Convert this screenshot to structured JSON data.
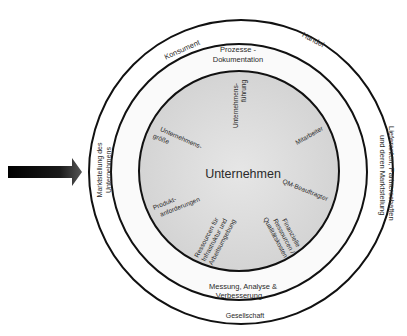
{
  "diagram": {
    "center_label": "Unternehmen",
    "outer_ring": {
      "labels": {
        "top_left": "Konsument",
        "top_right": "Handel",
        "right_line1": "Lieferanten, Partnerschaften",
        "right_line2": "und deren Marktstellung",
        "bottom": "Gesellschaft",
        "left_line1": "Marktstellung des",
        "left_line2": "Unternehmens"
      }
    },
    "middle_ring": {
      "labels": {
        "top_line1": "Prozesse -",
        "top_line2": "Dokumentation",
        "bottom_line1": "Messung, Analyse &",
        "bottom_line2": "Verbesserung"
      }
    },
    "inner_circle": {
      "factors": {
        "fuehrung_line1": "Unternehmens-",
        "fuehrung_line2": "führung",
        "mitarbeiter": "Mitarbeiter",
        "qm": "QM-Beauftragter",
        "finanz_line1": "Finanzielle",
        "finanz_line2": "Ressourcen /",
        "finanz_line3": "Qualitätskosten",
        "infra_line1": "Ressourcen für",
        "infra_line2": "Infrastruktur und",
        "infra_line3": "Arbeitsumgebung",
        "produkt_line1": "Produkt-",
        "produkt_line2": "anforderungen",
        "groesse_line1": "Unternehmens-",
        "groesse_line2": "größe"
      }
    },
    "colors": {
      "inner_fill": "#d9d9d9",
      "ring_fill": "#f4f4f4",
      "stroke": "#111111",
      "arrow": "#111111"
    }
  }
}
